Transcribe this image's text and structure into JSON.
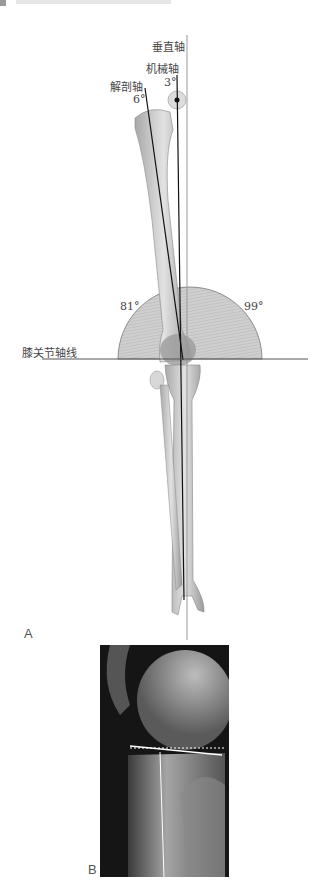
{
  "header": {
    "section_marker": "gray-square",
    "title_text": "(cropped header)"
  },
  "figure_a": {
    "panel_label": "A",
    "labels": {
      "vertical_axis": "垂直轴",
      "mechanical_axis": "机械轴",
      "anatomical_axis": "解剖轴",
      "knee_joint_line": "膝关节轴线"
    },
    "angles": {
      "mechanical_to_vertical": "3°",
      "anatomical_to_vertical": "6°",
      "medial_angle": "81°",
      "lateral_angle": "99°"
    },
    "colors": {
      "bone": "#d4d4d4",
      "bone_shade": "#9c9c9c",
      "protractor_fill": "#c8c8c8",
      "axis_line": "#111111",
      "vertical_line": "#999999"
    }
  },
  "figure_b": {
    "panel_label": "B",
    "description": "lateral knee radiograph with tibial plateau line, dotted reference line and tibial shaft axis"
  }
}
